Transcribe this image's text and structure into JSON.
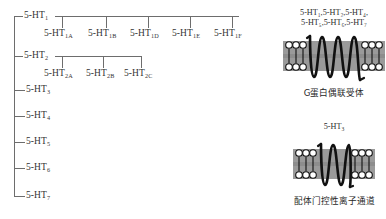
{
  "figure": {
    "tree": {
      "root_families": [
        {
          "label": "5-HT",
          "sub": "1",
          "y": 16
        },
        {
          "label": "5-HT",
          "sub": "2",
          "y": 56
        },
        {
          "label": "5-HT",
          "sub": "3",
          "y": 90
        },
        {
          "label": "5-HT",
          "sub": "4",
          "y": 116
        },
        {
          "label": "5-HT",
          "sub": "5",
          "y": 142
        },
        {
          "label": "5-HT",
          "sub": "6",
          "y": 168
        },
        {
          "label": "5-HT",
          "sub": "7",
          "y": 196
        }
      ],
      "subtypes_ht1": [
        {
          "label": "5-HT",
          "sub": "1A",
          "x": 44
        },
        {
          "label": "5-HT",
          "sub": "1B",
          "x": 88
        },
        {
          "label": "5-HT",
          "sub": "1D",
          "x": 130
        },
        {
          "label": "5-HT",
          "sub": "1E",
          "x": 172
        },
        {
          "label": "5-HT",
          "sub": "1F",
          "x": 214
        }
      ],
      "subtypes_ht2": [
        {
          "label": "5-HT",
          "sub": "2A",
          "x": 44
        },
        {
          "label": "5-HT",
          "sub": "2B",
          "x": 86
        },
        {
          "label": "5-HT",
          "sub": "2C",
          "x": 124
        }
      ]
    },
    "gpcr_panel": {
      "title_line1": "5-HT",
      "title_line1_subs": [
        "1",
        "2",
        "4"
      ],
      "title_line2_subs": [
        "5",
        "6",
        "7"
      ],
      "title_full_line1": "5-HT₁,5-HT₂,5-HT₄,",
      "title_full_line2": "5-HT₅,5-HT₆,5-HT₇",
      "caption": "G蛋白偶联受体",
      "helix_count": 7,
      "icon": "seven-transmembrane-helix-icon"
    },
    "ion_channel_panel": {
      "title": "5-HT",
      "title_sub": "3",
      "caption": "配体门控性离子通道",
      "helix_count": 4,
      "icon": "four-transmembrane-helix-icon"
    },
    "colors": {
      "line": "#6d6d6d",
      "text": "#2e2e2e",
      "membrane_band": "#9a9a9a",
      "protein": "#111111",
      "lipid_head": "#ffffff"
    }
  }
}
